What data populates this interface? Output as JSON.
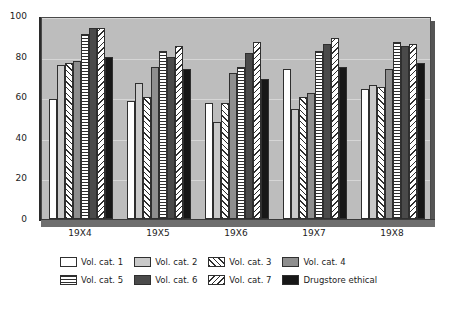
{
  "chart_data": {
    "type": "bar",
    "title": "",
    "xlabel": "",
    "ylabel": "",
    "ylim": [
      0,
      100
    ],
    "yticks": [
      0,
      20,
      40,
      60,
      80,
      100
    ],
    "grid": true,
    "legend_position": "bottom",
    "categories": [
      "19X4",
      "19X5",
      "19X6",
      "19X7",
      "19X8"
    ],
    "series": [
      {
        "name": "Vol. cat. 1",
        "pattern": "white",
        "values": [
          59,
          58,
          57,
          74,
          64
        ]
      },
      {
        "name": "Vol. cat. 2",
        "pattern": "light-gray",
        "values": [
          76,
          67,
          48,
          54,
          66
        ]
      },
      {
        "name": "Vol. cat. 3",
        "pattern": "forward-diagonal",
        "values": [
          77,
          60,
          57,
          60,
          65
        ]
      },
      {
        "name": "Vol. cat. 4",
        "pattern": "mid-gray",
        "values": [
          78,
          75,
          72,
          62,
          74
        ]
      },
      {
        "name": "Vol. cat. 5",
        "pattern": "horizontal-lines",
        "values": [
          91,
          83,
          75,
          83,
          87
        ]
      },
      {
        "name": "Vol. cat. 6",
        "pattern": "dark-gray",
        "values": [
          94,
          80,
          82,
          86,
          85
        ]
      },
      {
        "name": "Vol. cat. 7",
        "pattern": "backward-diagonal",
        "values": [
          94,
          85,
          87,
          89,
          86
        ]
      },
      {
        "name": "Drugstore ethical",
        "pattern": "black",
        "values": [
          80,
          74,
          69,
          75,
          77
        ]
      }
    ]
  },
  "legend": {
    "row1": [
      "Vol. cat. 1",
      "Vol. cat. 2",
      "Vol. cat. 3",
      "Vol. cat. 4"
    ],
    "row2": [
      "Vol. cat. 5",
      "Vol. cat. 6",
      "Vol. cat. 7",
      "Drugstore ethical"
    ]
  },
  "caption": "",
  "colors": {
    "plot_background": "#bdbdbd",
    "page_background": "#ffffff",
    "axis": "#2b2b2b",
    "gridline": "#d6d6d6",
    "outline": "#2f2f2f"
  }
}
